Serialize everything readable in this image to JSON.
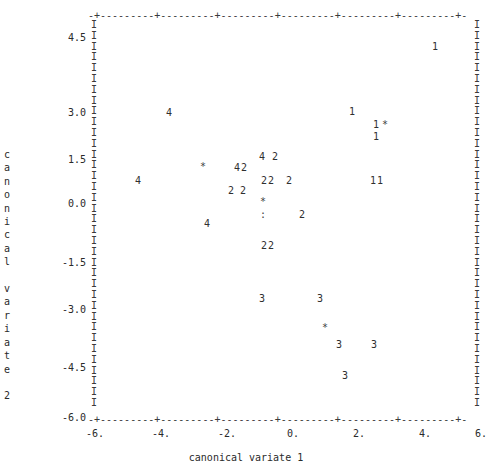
{
  "axes": {
    "xlabel": "canonical variate 1",
    "ylabel_chars": "c\na\nn\no\nn\ni\nc\na\nl\n\nv\na\nr\ni\na\nt\ne\n\n2",
    "ylabel": "canonical variate 2",
    "top_rail": "-+---------+---------+---------+---------+---------+---------+-",
    "bottom_rail": "-+---------+---------+---------+---------+---------+---------+-",
    "rail_char": "I",
    "rail_rows": 36
  },
  "ticks": {
    "x": [
      {
        "label": "-6.",
        "value": -6,
        "px": 95
      },
      {
        "label": "-4.",
        "value": -4,
        "px": 161
      },
      {
        "label": "-2.",
        "value": -2,
        "px": 227
      },
      {
        "label": "0.",
        "value": 0,
        "px": 293
      },
      {
        "label": "2.",
        "value": 2,
        "px": 359
      },
      {
        "label": "4.",
        "value": 4,
        "px": 425
      },
      {
        "label": "6.",
        "value": 6,
        "px": 481
      }
    ],
    "y": [
      {
        "label": "4.5",
        "value": 4.5,
        "px": 32
      },
      {
        "label": "3.0",
        "value": 3.0,
        "px": 107
      },
      {
        "label": "1.5",
        "value": 1.5,
        "px": 154
      },
      {
        "label": "0.0",
        "value": 0.0,
        "px": 198
      },
      {
        "label": "-1.5",
        "value": -1.5,
        "px": 257
      },
      {
        "label": "-3.0",
        "value": -3.0,
        "px": 304
      },
      {
        "label": "-4.5",
        "value": -4.5,
        "px": 362
      },
      {
        "label": "-6.0",
        "value": -6.0,
        "px": 412
      }
    ]
  },
  "chart_data": {
    "type": "scatter",
    "title": "",
    "xlabel": "canonical variate 1",
    "ylabel": "canonical variate 2",
    "xlim": [
      -6.4,
      6.4
    ],
    "ylim": [
      -6.4,
      5.4
    ],
    "grid": false,
    "legend": null,
    "note": "Character plot: each glyph is a group label (1-4) or a symbol (* = group centroid, : = two overlapping points).",
    "points": [
      {
        "text": "1",
        "x": 4.3,
        "y": 4.1,
        "px": 432,
        "py": 42
      },
      {
        "text": "4",
        "x": -2.6,
        "y": 2.4,
        "px": 166,
        "py": 108
      },
      {
        "text": "1",
        "x": 1.8,
        "y": 2.3,
        "px": 349,
        "py": 107
      },
      {
        "text": "1",
        "x": 2.5,
        "y": 1.9,
        "px": 373,
        "py": 120
      },
      {
        "text": "*",
        "x": 2.75,
        "y": 1.95,
        "px": 382,
        "py": 120
      },
      {
        "text": "1",
        "x": 2.5,
        "y": 1.55,
        "px": 373,
        "py": 132
      },
      {
        "text": "4",
        "x": -0.7,
        "y": 1.3,
        "px": 259,
        "py": 152
      },
      {
        "text": "2",
        "x": -0.3,
        "y": 1.3,
        "px": 272,
        "py": 152
      },
      {
        "text": "*",
        "x": -1.8,
        "y": 1.05,
        "px": 200,
        "py": 162
      },
      {
        "text": "4",
        "x": -1.2,
        "y": 1.05,
        "px": 234,
        "py": 163
      },
      {
        "text": "2",
        "x": -1.0,
        "y": 1.05,
        "px": 241,
        "py": 163
      },
      {
        "text": "4",
        "x": -4.7,
        "y": 0.55,
        "px": 135,
        "py": 176
      },
      {
        "text": "2",
        "x": -0.75,
        "y": 0.6,
        "px": 261,
        "py": 176
      },
      {
        "text": "2",
        "x": -0.55,
        "y": 0.6,
        "px": 268,
        "py": 176
      },
      {
        "text": "2",
        "x": -0.1,
        "y": 0.6,
        "px": 286,
        "py": 176
      },
      {
        "text": "1",
        "x": 2.4,
        "y": 0.6,
        "px": 370,
        "py": 176
      },
      {
        "text": "1",
        "x": 2.6,
        "y": 0.6,
        "px": 377,
        "py": 176
      },
      {
        "text": "2",
        "x": -1.35,
        "y": 0.4,
        "px": 228,
        "py": 186
      },
      {
        "text": "2",
        "x": -1.05,
        "y": 0.4,
        "px": 240,
        "py": 186
      },
      {
        "text": "*",
        "x": -0.75,
        "y": 0.12,
        "px": 260,
        "py": 197
      },
      {
        "text": ":",
        "x": -0.75,
        "y": -0.3,
        "px": 260,
        "py": 210
      },
      {
        "text": "2",
        "x": 0.2,
        "y": -0.3,
        "px": 299,
        "py": 210
      },
      {
        "text": "4",
        "x": -1.7,
        "y": -0.45,
        "px": 204,
        "py": 219
      },
      {
        "text": "2",
        "x": -0.75,
        "y": -1.25,
        "px": 261,
        "py": 241
      },
      {
        "text": "2",
        "x": -0.55,
        "y": -1.25,
        "px": 268,
        "py": 241
      },
      {
        "text": "3",
        "x": -0.9,
        "y": -2.9,
        "px": 259,
        "py": 294
      },
      {
        "text": "3",
        "x": 0.85,
        "y": -2.9,
        "px": 317,
        "py": 294
      },
      {
        "text": "*",
        "x": 1.0,
        "y": -3.6,
        "px": 322,
        "py": 323
      },
      {
        "text": "3",
        "x": 1.35,
        "y": -3.95,
        "px": 336,
        "py": 340
      },
      {
        "text": "3",
        "x": 2.4,
        "y": -3.95,
        "px": 371,
        "py": 340
      },
      {
        "text": "3",
        "x": 1.55,
        "y": -4.85,
        "px": 342,
        "py": 371
      }
    ]
  }
}
